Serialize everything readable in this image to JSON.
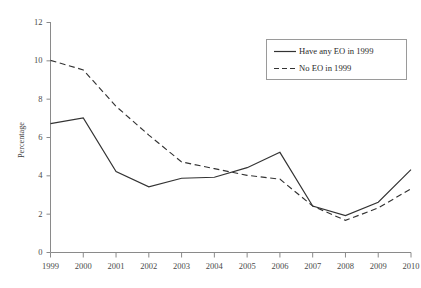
{
  "chart_data": {
    "type": "line",
    "title": "",
    "xlabel": "",
    "ylabel": "Percentage",
    "categories": [
      "1999",
      "2000",
      "2001",
      "2002",
      "2003",
      "2004",
      "2005",
      "2006",
      "2007",
      "2008",
      "2009",
      "2010"
    ],
    "x": [
      1999,
      2000,
      2001,
      2002,
      2003,
      2004,
      2005,
      2006,
      2007,
      2008,
      2009,
      2010
    ],
    "xlim": [
      1999,
      2010
    ],
    "ylim": [
      0,
      12
    ],
    "y_ticks": [
      0,
      2,
      4,
      6,
      8,
      10,
      12
    ],
    "grid": false,
    "legend_position": "top-right",
    "series": [
      {
        "name": "Have any EO in 1999",
        "style": "solid",
        "color": "#333333",
        "values": [
          6.7,
          7.0,
          4.2,
          3.4,
          3.85,
          3.9,
          4.4,
          5.2,
          2.4,
          1.9,
          2.6,
          4.3
        ]
      },
      {
        "name": "No EO in 1999",
        "style": "dashed",
        "color": "#333333",
        "values": [
          10.0,
          9.5,
          7.6,
          6.1,
          4.7,
          4.35,
          4.0,
          3.8,
          2.4,
          1.65,
          2.3,
          3.3
        ]
      }
    ]
  },
  "legend": {
    "items": [
      {
        "label": "Have any EO in 1999",
        "style": "solid"
      },
      {
        "label": "No EO in 1999",
        "style": "dashed"
      }
    ]
  },
  "axes": {
    "y_title": "Percentage",
    "y_tick_labels": [
      "12",
      "10",
      "8",
      "6",
      "4",
      "2",
      "0"
    ],
    "x_tick_labels": [
      "1999",
      "2000",
      "2001",
      "2002",
      "2003",
      "2004",
      "2005",
      "2006",
      "2007",
      "2008",
      "2009",
      "2010"
    ]
  }
}
